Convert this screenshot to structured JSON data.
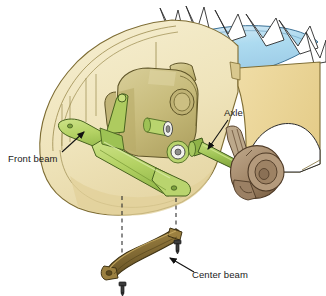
{
  "figure": {
    "type": "technical-illustration",
    "background_color": "#ffffff",
    "width": 326,
    "height": 296
  },
  "labels": [
    {
      "id": "front-beam",
      "text": "Front beam",
      "x": 8,
      "y": 160,
      "leader": "arrow pointing up-right to green front beam",
      "color": "#1a1a1a"
    },
    {
      "id": "axle",
      "text": "Axle",
      "x": 224,
      "y": 115,
      "leader": "arrow pointing down-left to green axle shaft",
      "color": "#1a1a1a"
    },
    {
      "id": "center-beam",
      "text": "Center beam",
      "x": 190,
      "y": 276,
      "leader": "arrow pointing up-left to brown center beam",
      "color": "#1a1a1a"
    }
  ],
  "parts": [
    {
      "id": "vehicle-body",
      "name": "vehicle body cutaway",
      "color": "#f0e6c0",
      "stroke": "#8a7a40"
    },
    {
      "id": "fender",
      "name": "front fender panel",
      "color": "#edd79a",
      "stroke": "#8a7a40"
    },
    {
      "id": "windshield",
      "name": "windshield glass",
      "color": "#b9dcf0",
      "stroke": "#4a7fa0"
    },
    {
      "id": "transmission",
      "name": "transmission housing",
      "color": "#cfc48a",
      "stroke": "#6b6030"
    },
    {
      "id": "front-beam",
      "name": "front beam crossmember",
      "color": "#b6d46a",
      "stroke": "#4e6b22"
    },
    {
      "id": "axle",
      "name": "drive axle shaft",
      "color": "#a8c95c",
      "stroke": "#46601e"
    },
    {
      "id": "hub",
      "name": "wheel hub and knuckle",
      "color": "#a98e72",
      "stroke": "#5a4530"
    },
    {
      "id": "center-beam",
      "name": "center beam",
      "color": "#8a7138",
      "stroke": "#4a3a15"
    },
    {
      "id": "bolt",
      "name": "mounting bolt",
      "color": "#3a3a3a",
      "stroke": "#1a1a1a",
      "count": 2
    },
    {
      "id": "alignment-line",
      "name": "dashed assembly alignment line",
      "color": "#3a3a3a",
      "count": 2
    }
  ]
}
